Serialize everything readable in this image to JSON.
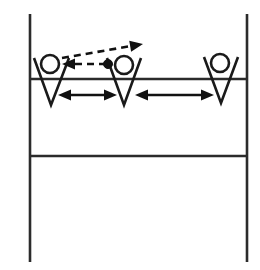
{
  "diagram": {
    "type": "sports-tactical-diagram",
    "background_color": "#ffffff",
    "line_color": "#2b2b2b",
    "figure_color": "#1a1a1a",
    "ball_color": "#111111",
    "court": {
      "sideline_left": {
        "x": 30,
        "y1": 14,
        "y2": 262
      },
      "sideline_right": {
        "x": 247,
        "y1": 14,
        "y2": 262
      },
      "attack_line": {
        "y": 79,
        "x1": 30,
        "x2": 247
      },
      "center_line": {
        "y": 156,
        "x1": 30,
        "x2": 247
      }
    },
    "players": [
      {
        "id": "player-left",
        "label": "",
        "head": {
          "cx": 50,
          "cy": 64,
          "r": 9
        },
        "body": {
          "apex_x": 51,
          "apex_y": 105,
          "left_x": 34,
          "left_y": 58,
          "right_x": 69,
          "right_y": 58
        }
      },
      {
        "id": "player-middle",
        "label": "",
        "head": {
          "cx": 124,
          "cy": 65,
          "r": 9
        },
        "body": {
          "apex_x": 124,
          "apex_y": 105,
          "left_x": 107,
          "left_y": 58,
          "right_x": 141,
          "right_y": 58
        }
      },
      {
        "id": "player-right",
        "label": "",
        "head": {
          "cx": 220,
          "cy": 63,
          "r": 9
        },
        "body": {
          "apex_x": 221,
          "apex_y": 103,
          "left_x": 204,
          "left_y": 57,
          "right_x": 238,
          "right_y": 57
        }
      }
    ],
    "ball": {
      "cx": 108,
      "cy": 64,
      "r": 4.5
    },
    "ball_paths": [
      {
        "id": "ball-path-to-left-player",
        "style": "dashed",
        "from": {
          "x": 106,
          "y": 64
        },
        "to": {
          "x": 62,
          "y": 64
        },
        "arrow_at": "to"
      },
      {
        "id": "ball-path-upper-right",
        "style": "dashed",
        "from": {
          "x": 62,
          "y": 58
        },
        "to": {
          "x": 143,
          "y": 44
        },
        "arrow_at": "to"
      }
    ],
    "spacing_arrows": [
      {
        "id": "spacing-arrow-left-middle",
        "style": "solid-double-headed",
        "from": {
          "x": 58,
          "y": 95
        },
        "to": {
          "x": 117,
          "y": 95
        }
      },
      {
        "id": "spacing-arrow-middle-right",
        "style": "solid-double-headed",
        "from": {
          "x": 135,
          "y": 95
        },
        "to": {
          "x": 214,
          "y": 95
        }
      }
    ]
  }
}
